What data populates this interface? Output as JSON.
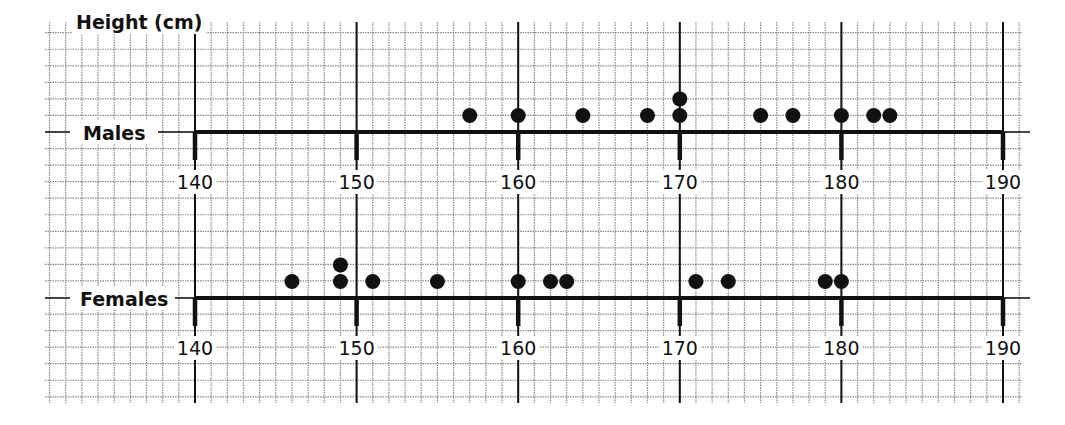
{
  "title": "Height (cm)",
  "chart_data": {
    "type": "scatter",
    "subtype": "dot_plot",
    "title": "Height (cm)",
    "xlabel": "Height (cm)",
    "ylabel": "",
    "xlim": [
      140,
      190
    ],
    "x_ticks": [
      140,
      150,
      160,
      170,
      180,
      190
    ],
    "grid": true,
    "series": [
      {
        "name": "Males",
        "values": [
          157,
          160,
          164,
          168,
          170,
          170,
          175,
          177,
          180,
          182,
          183
        ]
      },
      {
        "name": "Females",
        "values": [
          146,
          149,
          149,
          151,
          155,
          160,
          162,
          163,
          171,
          173,
          179,
          180
        ]
      }
    ]
  },
  "plots": [
    {
      "label": "Males",
      "tick_labels": [
        "140",
        "150",
        "160",
        "170",
        "180",
        "190"
      ]
    },
    {
      "label": "Females",
      "tick_labels": [
        "140",
        "150",
        "160",
        "170",
        "180",
        "190"
      ]
    }
  ],
  "colors": {
    "ink": "#111111",
    "grid": "#8a8a8a",
    "background": "#ffffff"
  }
}
